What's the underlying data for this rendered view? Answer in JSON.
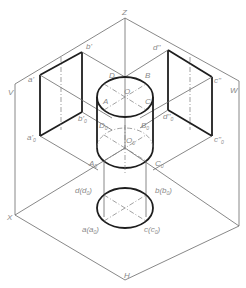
{
  "figure": {
    "type": "orthographic-to-isometric projection of a cylinder onto V, H, W planes",
    "planes": {
      "V": "V",
      "W": "W",
      "H": "H"
    },
    "axes": {
      "Z": "Z",
      "X": "X"
    },
    "labels": {
      "a_prime": "a'",
      "b_prime": "b'",
      "a_prime_0": "a'",
      "a_prime_0_sub": "0",
      "b_prime_0": "b'",
      "b_prime_0_sub": "0",
      "d_dprime": "d''",
      "c_dprime": "c''",
      "d_dprime_0": "d''",
      "d_dprime_0_sub": "0",
      "c_dprime_0": "c''",
      "c_dprime_0_sub": "0",
      "A": "A",
      "B": "B",
      "C": "C",
      "D": "D",
      "O": "O",
      "A0": "A",
      "A0_sub": "0",
      "B0": "B",
      "B0_sub": "0",
      "C0": "C",
      "C0_sub": "0",
      "D0": "D",
      "D0_sub": "0",
      "O0": "O",
      "O0_sub": "0",
      "d_d0": "d(d",
      "d_d0_sub": "0",
      "d_d0_end": ")",
      "b_b0": "b(b",
      "b_b0_sub": "0",
      "b_b0_end": ")",
      "a_a0": "a(a",
      "a_a0_sub": "0",
      "a_a0_end": ")",
      "c_c0": "c(c",
      "c_c0_sub": "0",
      "c_c0_end": ")"
    }
  }
}
